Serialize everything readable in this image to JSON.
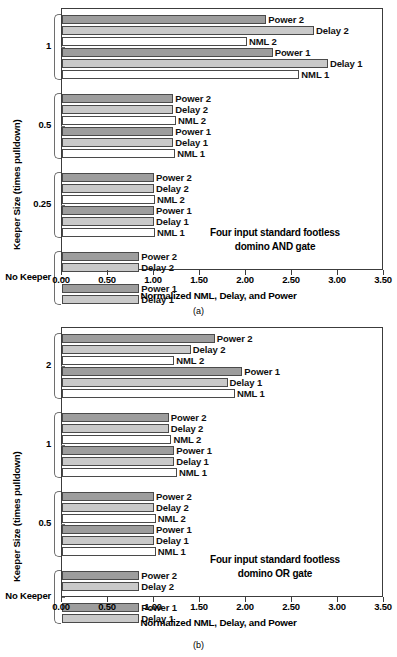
{
  "figure": {
    "axis": {
      "x0": 0.0,
      "x1": 3.5,
      "ticks": [
        "0.00",
        "0.50",
        "1.00",
        "1.50",
        "2.00",
        "2.50",
        "3.00",
        "3.50"
      ]
    },
    "colors": {
      "power": "#9d9d9d",
      "delay": "#c9c9c9",
      "nml": "#ffffff",
      "frame": "#3c3c3c"
    }
  },
  "panel_a": {
    "caption": "(a)",
    "annotation_line1": "Four input standard footless",
    "annotation_line2": "domino AND gate",
    "xlabel": "Normalized NML, Delay, and Power",
    "ylabel": "Keeper Size (times pulldown)",
    "group_labels": [
      "1",
      "0.5",
      "0.25",
      "No Keeper"
    ],
    "series_labels": [
      "Power 2",
      "Delay 2",
      "NML 2",
      "Power 1",
      "Delay 1",
      "NML 1"
    ]
  },
  "panel_b": {
    "caption": "(b)",
    "annotation_line1": "Four input standard footless",
    "annotation_line2": "domino OR gate",
    "xlabel": "Normalized NML, Delay, and Power",
    "ylabel": "Keeper Size (times pulldown)",
    "group_labels": [
      "2",
      "1",
      "0.5",
      "No Keeper"
    ],
    "series_labels": [
      "Power 2",
      "Delay 2",
      "NML 2",
      "Power 1",
      "Delay 1",
      "NML 1"
    ]
  },
  "chart_data": [
    {
      "type": "bar",
      "orientation": "horizontal",
      "title": "Four input standard footless domino AND gate",
      "xlabel": "Normalized NML, Delay, and Power",
      "ylabel": "Keeper Size (times pulldown)",
      "xlim": [
        0.0,
        3.5
      ],
      "xticks": [
        0.0,
        0.5,
        1.0,
        1.5,
        2.0,
        2.5,
        3.0,
        3.5
      ],
      "grid": false,
      "legend": "inline-labels",
      "categories": [
        "1",
        "0.5",
        "0.25",
        "No Keeper"
      ],
      "groups": [
        {
          "category": "1",
          "bars": [
            {
              "label": "Power 2",
              "kind": "power",
              "value": 2.22
            },
            {
              "label": "Delay 2",
              "kind": "delay",
              "value": 2.74
            },
            {
              "label": "NML 2",
              "kind": "nml",
              "value": 2.01
            },
            {
              "label": "Power 1",
              "kind": "power",
              "value": 2.29
            },
            {
              "label": "Delay 1",
              "kind": "delay",
              "value": 2.89
            },
            {
              "label": "NML 1",
              "kind": "nml",
              "value": 2.58
            }
          ]
        },
        {
          "category": "0.5",
          "bars": [
            {
              "label": "Power 2",
              "kind": "power",
              "value": 1.21
            },
            {
              "label": "Delay 2",
              "kind": "delay",
              "value": 1.21
            },
            {
              "label": "NML 2",
              "kind": "nml",
              "value": 1.24
            },
            {
              "label": "Power 1",
              "kind": "power",
              "value": 1.21
            },
            {
              "label": "Delay 1",
              "kind": "delay",
              "value": 1.21
            },
            {
              "label": "NML 1",
              "kind": "nml",
              "value": 1.23
            }
          ]
        },
        {
          "category": "0.25",
          "bars": [
            {
              "label": "Power 2",
              "kind": "power",
              "value": 1.0
            },
            {
              "label": "Delay 2",
              "kind": "delay",
              "value": 1.0
            },
            {
              "label": "NML 2",
              "kind": "nml",
              "value": 1.01
            },
            {
              "label": "Power 1",
              "kind": "power",
              "value": 1.0
            },
            {
              "label": "Delay 1",
              "kind": "delay",
              "value": 1.0
            },
            {
              "label": "NML 1",
              "kind": "nml",
              "value": 1.01
            }
          ]
        },
        {
          "category": "No Keeper",
          "bars": [
            {
              "label": "Power 2",
              "kind": "power",
              "value": 0.84
            },
            {
              "label": "Delay 2",
              "kind": "delay",
              "value": 0.84
            },
            {
              "label": "Power 1",
              "kind": "power",
              "value": 0.84
            },
            {
              "label": "Delay 1",
              "kind": "delay",
              "value": 0.84
            }
          ]
        }
      ]
    },
    {
      "type": "bar",
      "orientation": "horizontal",
      "title": "Four input standard footless domino OR gate",
      "xlabel": "Normalized NML, Delay, and Power",
      "ylabel": "Keeper Size (times pulldown)",
      "xlim": [
        0.0,
        3.5
      ],
      "xticks": [
        0.0,
        0.5,
        1.0,
        1.5,
        2.0,
        2.5,
        3.0,
        3.5
      ],
      "grid": false,
      "legend": "inline-labels",
      "categories": [
        "2",
        "1",
        "0.5",
        "No Keeper"
      ],
      "groups": [
        {
          "category": "2",
          "bars": [
            {
              "label": "Power 2",
              "kind": "power",
              "value": 1.66
            },
            {
              "label": "Delay 2",
              "kind": "delay",
              "value": 1.4
            },
            {
              "label": "NML 2",
              "kind": "nml",
              "value": 1.22
            },
            {
              "label": "Power 1",
              "kind": "power",
              "value": 1.96
            },
            {
              "label": "Delay 1",
              "kind": "delay",
              "value": 1.8
            },
            {
              "label": "NML 1",
              "kind": "nml",
              "value": 1.88
            }
          ]
        },
        {
          "category": "1",
          "bars": [
            {
              "label": "Power 2",
              "kind": "power",
              "value": 1.16
            },
            {
              "label": "Delay 2",
              "kind": "delay",
              "value": 1.16
            },
            {
              "label": "NML 2",
              "kind": "nml",
              "value": 1.19
            },
            {
              "label": "Power 1",
              "kind": "power",
              "value": 1.22
            },
            {
              "label": "Delay 1",
              "kind": "delay",
              "value": 1.22
            },
            {
              "label": "NML 1",
              "kind": "nml",
              "value": 1.25
            }
          ]
        },
        {
          "category": "0.5",
          "bars": [
            {
              "label": "Power 2",
              "kind": "power",
              "value": 1.0
            },
            {
              "label": "Delay 2",
              "kind": "delay",
              "value": 1.0
            },
            {
              "label": "NML 2",
              "kind": "nml",
              "value": 1.02
            },
            {
              "label": "Power 1",
              "kind": "power",
              "value": 1.0
            },
            {
              "label": "Delay 1",
              "kind": "delay",
              "value": 1.0
            },
            {
              "label": "NML 1",
              "kind": "nml",
              "value": 1.02
            }
          ]
        },
        {
          "category": "No Keeper",
          "bars": [
            {
              "label": "Power 2",
              "kind": "power",
              "value": 0.84
            },
            {
              "label": "Delay 2",
              "kind": "delay",
              "value": 0.84
            },
            {
              "label": "Power 1",
              "kind": "power",
              "value": 0.84
            },
            {
              "label": "Delay 1",
              "kind": "delay",
              "value": 0.84
            }
          ]
        }
      ]
    }
  ]
}
